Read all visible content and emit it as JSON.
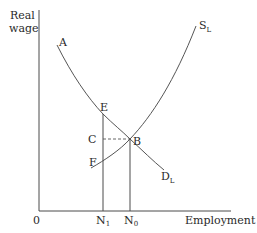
{
  "diagram": {
    "type": "labour-market supply-demand",
    "y_axis_label_line1": "Real",
    "y_axis_label_line2": "wage",
    "x_axis_label": "Employment",
    "origin_label": "0",
    "curves": {
      "demand": {
        "name": "D",
        "subscript": "L",
        "start_label": "A"
      },
      "supply": {
        "name": "S",
        "subscript": "L",
        "start_label": "F"
      }
    },
    "points": {
      "E": "E",
      "B": "B",
      "C": "C"
    },
    "x_ticks": [
      {
        "name": "N",
        "subscript": "1"
      },
      {
        "name": "N",
        "subscript": "0"
      }
    ]
  }
}
